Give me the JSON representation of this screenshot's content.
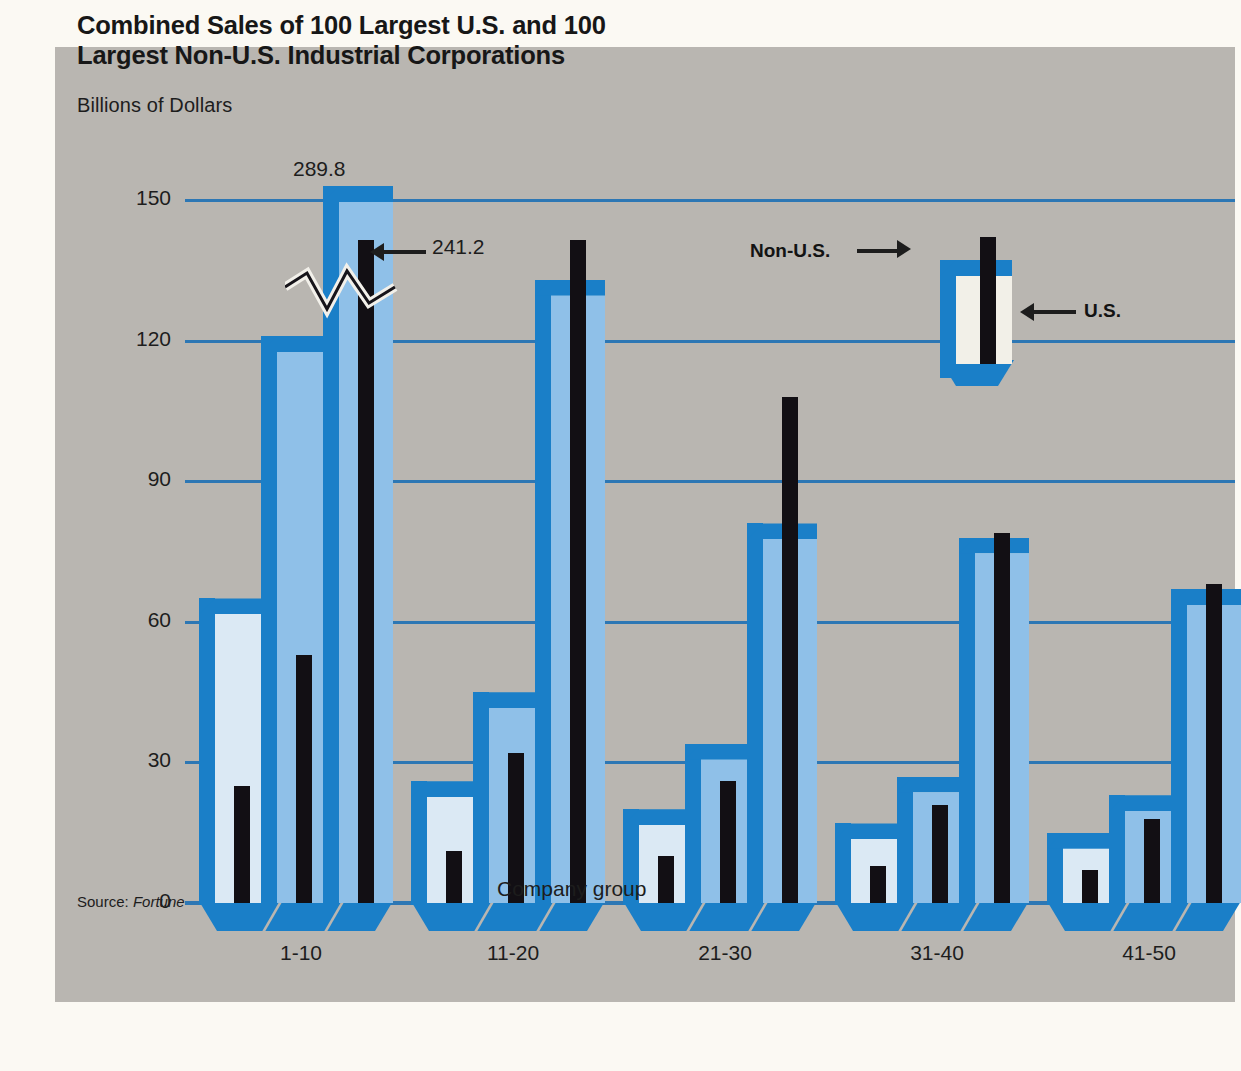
{
  "title": "Combined Sales of 100 Largest U.S. and 100 Largest Non-U.S. Industrial Corporations",
  "title_line1": "Combined Sales of 100 Largest U.S. and 100",
  "title_line2": "Largest Non-U.S. Industrial Corporations",
  "ylabel": "Billions of Dollars",
  "xlabel": "Company group",
  "source_prefix": "Source: ",
  "source_name": "Fortune",
  "legend": {
    "nonus_label": "Non-U.S.",
    "us_label": "U.S."
  },
  "annotations": [
    {
      "text": "289.8",
      "note": "top label over tallest U.S. bar, group 1-10"
    },
    {
      "text": "241.2",
      "note": "arrow label to tallest Non-U.S. bar, group 1-10"
    }
  ],
  "colors": {
    "page_background": "#fbf9f3",
    "panel_background": "#b9b6b1",
    "gridline": "#2d77b4",
    "bar_side_3d": "#1a7fc8",
    "us_bar_light": "#dbe9f4",
    "us_bar_blue": "#8fc0e8",
    "nonus_bar": "#120f14",
    "text": "#1d1d1d"
  },
  "chart_data": {
    "type": "bar",
    "title": "Combined Sales of 100 Largest U.S. and 100 Largest Non-U.S. Industrial Corporations",
    "xlabel": "Company group",
    "ylabel": "Billions of Dollars",
    "ylim": [
      0,
      150
    ],
    "yticks": [
      0,
      30,
      60,
      90,
      120,
      150
    ],
    "grid": true,
    "legend_position": "upper-right",
    "axis_break": true,
    "axis_break_note": "Bars in group 1-10 exceed the 150 scale; zigzag break drawn",
    "categories": [
      "1-10",
      "11-20",
      "21-30",
      "31-40",
      "41-50"
    ],
    "period_labels": [
      "1960",
      "1970",
      "1980"
    ],
    "period_note": "Each company group shows three successive bar pairs (earliest to latest)",
    "series": [
      {
        "name": "U.S.",
        "color": "#dbe9f4",
        "groups": [
          {
            "category": "1-10",
            "values": [
              62,
              118,
              289.8
            ]
          },
          {
            "category": "11-20",
            "values": [
              23,
              42,
              130
            ]
          },
          {
            "category": "21-30",
            "values": [
              17,
              31,
              78
            ]
          },
          {
            "category": "31-40",
            "values": [
              14,
              24,
              75
            ]
          },
          {
            "category": "41-50",
            "values": [
              12,
              20,
              64
            ]
          }
        ]
      },
      {
        "name": "Non-U.S.",
        "color": "#120f14",
        "groups": [
          {
            "category": "1-10",
            "values": [
              25,
              53,
              241.2
            ]
          },
          {
            "category": "11-20",
            "values": [
              11,
              32,
              142
            ]
          },
          {
            "category": "21-30",
            "values": [
              10,
              26,
              108
            ]
          },
          {
            "category": "31-40",
            "values": [
              8,
              21,
              79
            ]
          },
          {
            "category": "41-50",
            "values": [
              7,
              18,
              68
            ]
          }
        ]
      }
    ],
    "labeled_points": [
      {
        "category": "1-10",
        "series": "U.S.",
        "value": 289.8,
        "label": "289.8"
      },
      {
        "category": "1-10",
        "series": "Non-U.S.",
        "value": 241.2,
        "label": "241.2"
      }
    ]
  }
}
